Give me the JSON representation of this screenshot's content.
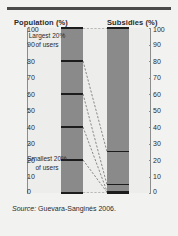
{
  "figure": {
    "left_axis_title": "Population (%)",
    "right_axis_title": "Subsidies (%)",
    "source": "Source:",
    "source_citation": "Guevara-Sanginés 2006.",
    "annotations": {
      "top": "Largest 20% of users",
      "bottom": "Smallest 20% of users"
    },
    "colors": {
      "bar": "#8a8a8a",
      "plot_background": "#ededeb",
      "figure_background": "#f2f2f0",
      "rule": "#4a4a4a",
      "segment_line": "#1c1c1c",
      "axis": "#8d8d8d",
      "text": "#2b2b2b"
    }
  },
  "chart_data": {
    "type": "bar",
    "title": "",
    "subtitle": "",
    "xlabel": "",
    "ylabel": "Population (%) / Subsidies (%)",
    "ylim": [
      0,
      100
    ],
    "grid": false,
    "legend": "none",
    "axes": {
      "left": {
        "label": "Population (%)",
        "ticks": [
          0,
          10,
          20,
          30,
          40,
          50,
          60,
          70,
          80,
          90,
          100
        ],
        "range": [
          0,
          100
        ]
      },
      "right": {
        "label": "Subsidies (%)",
        "ticks": [
          0,
          10,
          20,
          30,
          40,
          50,
          60,
          70,
          80,
          90,
          100
        ],
        "range": [
          0,
          100
        ]
      }
    },
    "categories": [
      "Population",
      "Subsidies"
    ],
    "stacks": [
      {
        "name": "Population",
        "axis": "left",
        "segments": [
          {
            "label": "Largest 20% of users",
            "from": 80,
            "to": 100,
            "value": 20
          },
          {
            "label": "Second quintile",
            "from": 60,
            "to": 80,
            "value": 20
          },
          {
            "label": "Third quintile",
            "from": 40,
            "to": 60,
            "value": 20
          },
          {
            "label": "Fourth quintile",
            "from": 20,
            "to": 40,
            "value": 20
          },
          {
            "label": "Smallest 20% of users",
            "from": 0,
            "to": 20,
            "value": 20
          }
        ]
      },
      {
        "name": "Subsidies",
        "axis": "right",
        "segments": [
          {
            "label": "Largest 20% of users",
            "from": 25,
            "to": 100,
            "value": 75
          },
          {
            "label": "Second quintile",
            "from": 5,
            "to": 25,
            "value": 20
          },
          {
            "label": "Third quintile",
            "from": 1,
            "to": 5,
            "value": 4
          },
          {
            "label": "Fourth quintile",
            "from": 0.5,
            "to": 1,
            "value": 0.5
          },
          {
            "label": "Smallest 20% of users",
            "from": 0,
            "to": 0.5,
            "value": 0.5
          }
        ]
      }
    ],
    "connectors": [
      {
        "from_left": 100,
        "to_right": 100
      },
      {
        "from_left": 80,
        "to_right": 25
      },
      {
        "from_left": 60,
        "to_right": 5
      },
      {
        "from_left": 40,
        "to_right": 1
      },
      {
        "from_left": 20,
        "to_right": 0.5
      },
      {
        "from_left": 0,
        "to_right": 0
      }
    ],
    "annotations": [
      {
        "text": "Largest 20% of users",
        "at": 90
      },
      {
        "text": "Smallest 20% of users",
        "at": 10
      }
    ]
  }
}
